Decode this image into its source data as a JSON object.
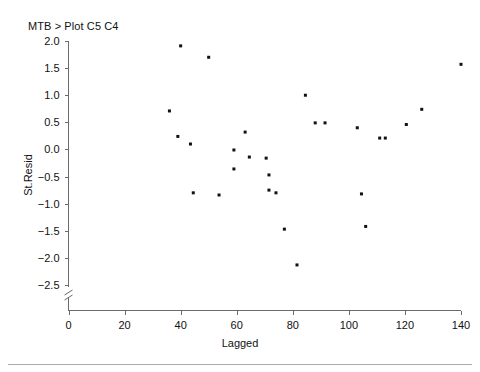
{
  "session": {
    "command_line": "MTB > Plot C5 C4"
  },
  "chart_data": {
    "type": "scatter",
    "title": "",
    "xlabel": "Lagged",
    "ylabel": "St.Resid",
    "xlim": [
      0,
      140
    ],
    "ylim": [
      -2.5,
      2.0
    ],
    "xticks": [
      0,
      20,
      40,
      60,
      80,
      100,
      120,
      140
    ],
    "xtick_labels": [
      "0",
      "20",
      "40",
      "60",
      "80",
      "100",
      "120",
      "140"
    ],
    "yticks": [
      -2.5,
      -2.0,
      -1.5,
      -1.0,
      -0.5,
      0.0,
      0.5,
      1.0,
      1.5,
      2.0
    ],
    "ytick_labels": [
      "-2.5",
      "-2.0",
      "-1.5",
      "-1.0",
      "-0.5",
      "0.0",
      "0.5",
      "1.0",
      "1.5",
      "2.0"
    ],
    "grid": false,
    "legend": null,
    "y_axis_break": true,
    "marker": {
      "shape": "square",
      "size_px": 3,
      "color": "#111111"
    },
    "x": [
      36,
      39,
      40,
      43.5,
      44.5,
      50,
      53.7,
      59,
      59,
      63,
      64.5,
      70.5,
      71.5,
      71.5,
      74,
      77,
      81.5,
      84.5,
      88,
      91.5,
      103,
      104.5,
      106,
      111,
      113,
      120.5,
      126,
      140
    ],
    "y": [
      0.71,
      0.24,
      1.91,
      0.1,
      -0.8,
      1.7,
      -0.84,
      -0.01,
      -0.36,
      0.32,
      -0.14,
      -0.16,
      -0.47,
      -0.75,
      -0.8,
      -1.47,
      -2.13,
      1.0,
      0.49,
      0.49,
      0.4,
      -0.82,
      -1.42,
      0.21,
      0.21,
      0.46,
      0.74,
      1.57
    ],
    "points": [
      {
        "x": 36,
        "y": 0.71
      },
      {
        "x": 39,
        "y": 0.24
      },
      {
        "x": 40,
        "y": 1.91
      },
      {
        "x": 43.5,
        "y": 0.1
      },
      {
        "x": 44.5,
        "y": -0.8
      },
      {
        "x": 50,
        "y": 1.7
      },
      {
        "x": 53.7,
        "y": -0.84
      },
      {
        "x": 59,
        "y": -0.01
      },
      {
        "x": 59,
        "y": -0.36
      },
      {
        "x": 63,
        "y": 0.32
      },
      {
        "x": 64.5,
        "y": -0.14
      },
      {
        "x": 70.5,
        "y": -0.16
      },
      {
        "x": 71.5,
        "y": -0.47
      },
      {
        "x": 71.5,
        "y": -0.75
      },
      {
        "x": 74,
        "y": -0.8
      },
      {
        "x": 77,
        "y": -1.47
      },
      {
        "x": 81.5,
        "y": -2.13
      },
      {
        "x": 84.5,
        "y": 1.0
      },
      {
        "x": 88,
        "y": 0.49
      },
      {
        "x": 91.5,
        "y": 0.49
      },
      {
        "x": 103,
        "y": 0.4
      },
      {
        "x": 104.5,
        "y": -0.82
      },
      {
        "x": 106,
        "y": -1.42
      },
      {
        "x": 111,
        "y": 0.21
      },
      {
        "x": 113,
        "y": 0.21
      },
      {
        "x": 120.5,
        "y": 0.46
      },
      {
        "x": 126,
        "y": 0.74
      },
      {
        "x": 140,
        "y": 1.57
      }
    ],
    "n_points": 28,
    "colors": {
      "marker": "#111111",
      "axis": "#6b6b6b",
      "text": "#111111",
      "background": "#ffffff"
    }
  }
}
